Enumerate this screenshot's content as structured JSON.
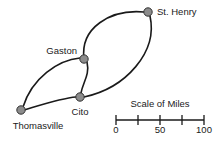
{
  "figure": {
    "type": "road-map-diagram",
    "background_color": "#ffffff",
    "road_color": "#1a1a1a",
    "city_marker_fill": "#8c8c8c",
    "city_marker_stroke": "#333333"
  },
  "cities": [
    {
      "id": "st-henry",
      "name": "St. Henry",
      "marker_x": 148,
      "marker_y": 12,
      "label_x": 157,
      "label_y": 12,
      "label_anchor": "start"
    },
    {
      "id": "gaston",
      "name": "Gaston",
      "marker_x": 84,
      "marker_y": 59,
      "label_x": 77,
      "label_y": 51,
      "label_anchor": "end"
    },
    {
      "id": "cito",
      "name": "Cito",
      "marker_x": 80,
      "marker_y": 97,
      "label_x": 80,
      "label_y": 112,
      "label_anchor": "middle"
    },
    {
      "id": "thomasville",
      "name": "Thomasville",
      "marker_x": 21,
      "marker_y": 110,
      "label_x": 38,
      "label_y": 126,
      "label_anchor": "middle"
    }
  ],
  "roads": [
    {
      "id": "gaston-st-henry",
      "from": "gaston",
      "to": "st-henry",
      "path": "M 84 59 C 80 28, 110 9, 144 12"
    },
    {
      "id": "st-henry-cito",
      "from": "st-henry",
      "to": "cito",
      "path": "M 150 16 C 158 52, 126 88, 84 97"
    },
    {
      "id": "gaston-cito",
      "from": "gaston",
      "to": "cito",
      "path": "M 87 62 C 90 75, 83 82, 81 93"
    },
    {
      "id": "thomasville-gaston",
      "from": "thomasville",
      "to": "gaston",
      "path": "M 23 107 C 32 78, 58 60, 80 58"
    },
    {
      "id": "thomasville-cito",
      "from": "thomasville",
      "to": "cito",
      "path": "M 24 110 C 44 104, 62 98, 76 97"
    }
  ],
  "scale_bar": {
    "title": "Scale of Miles",
    "title_x": 160,
    "title_y": 107,
    "axis_y": 120,
    "x_start": 116,
    "x_end": 204,
    "tick_height": 5,
    "ticks": [
      {
        "value": 0,
        "x": 116,
        "label": "0"
      },
      {
        "value": 25,
        "x": 138,
        "label": ""
      },
      {
        "value": 50,
        "x": 160,
        "label": "50"
      },
      {
        "value": 75,
        "x": 182,
        "label": ""
      },
      {
        "value": 100,
        "x": 204,
        "label": "100"
      }
    ],
    "label_y": 133
  }
}
